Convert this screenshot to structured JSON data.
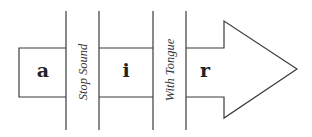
{
  "diagram": {
    "segments": [
      {
        "letter": "a"
      },
      {
        "letter": "i"
      },
      {
        "letter": "r"
      }
    ],
    "separators": [
      {
        "label": "Stop Sound"
      },
      {
        "label": "With Tongue"
      }
    ],
    "colors": {
      "stroke": "#3a3a3a",
      "background": "#ffffff"
    }
  }
}
